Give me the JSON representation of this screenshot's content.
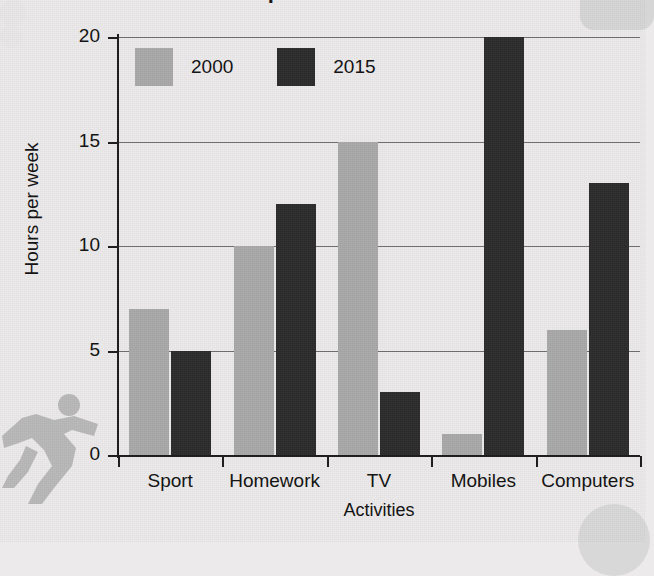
{
  "figure": {
    "title_fragment": "Time spent on activities",
    "runner_icon": "running-person-icon",
    "deco_top_right": "rounded-blob-decoration",
    "deco_bottom_right": "circle-blob-decoration"
  },
  "chart_data": {
    "type": "bar",
    "title": "",
    "xlabel": "Activities",
    "ylabel": "Hours per week",
    "categories": [
      "Sport",
      "Homework",
      "TV",
      "Mobiles",
      "Computers"
    ],
    "series": [
      {
        "name": "2000",
        "color": "#a9a9a9",
        "values": [
          7,
          10,
          15,
          1,
          6
        ]
      },
      {
        "name": "2015",
        "color": "#2c2c2c",
        "values": [
          5,
          12,
          3,
          20,
          13
        ]
      }
    ],
    "ylim": [
      0,
      20
    ],
    "yticks": [
      0,
      5,
      10,
      15,
      20
    ],
    "ytick_labels": [
      "0",
      "5",
      "10",
      "15",
      "20"
    ],
    "grid": "horizontal",
    "legend_position": "top-left-inside"
  }
}
